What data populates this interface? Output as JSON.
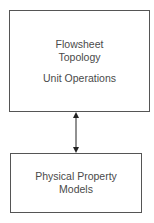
{
  "diagram": {
    "top_box": {
      "lines": [
        "Flowsheet",
        "Topology",
        "Unit Operations"
      ]
    },
    "bottom_box": {
      "lines": [
        "Physical Property",
        "Models"
      ]
    },
    "connector": {
      "type": "bidirectional-arrow",
      "from": "top_box",
      "to": "bottom_box"
    },
    "colors": {
      "border": "#555555",
      "text": "#4a4a4a",
      "arrow": "#222222"
    }
  }
}
